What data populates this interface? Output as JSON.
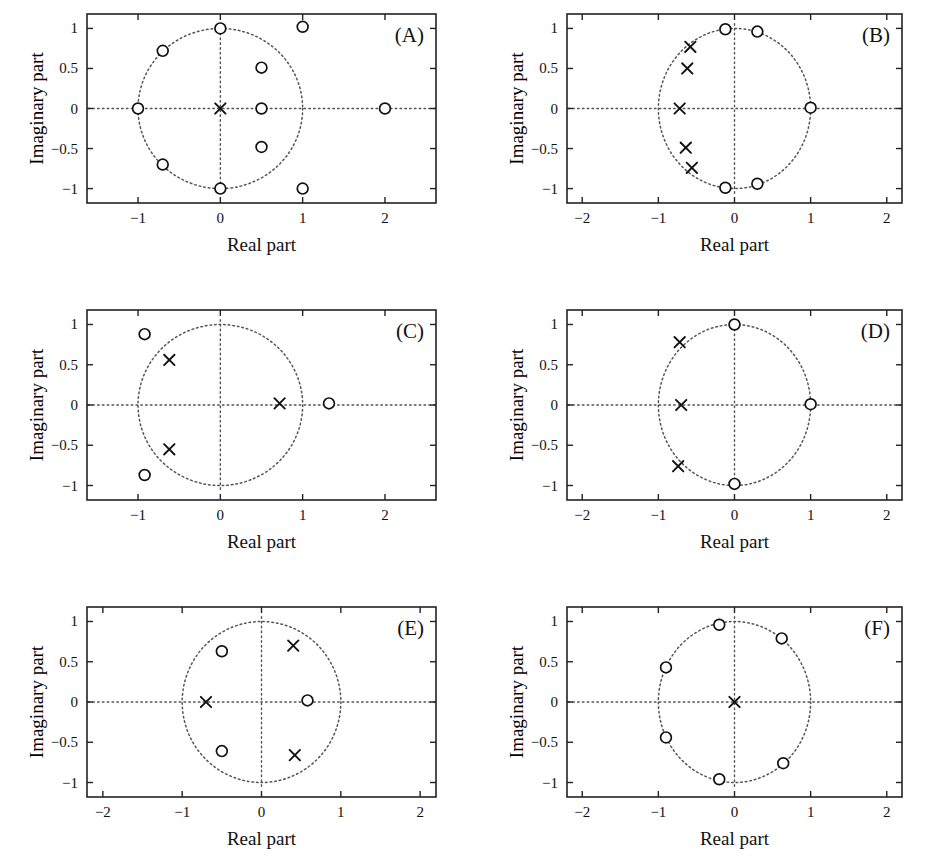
{
  "figure": {
    "type": "pole-zero-plots",
    "panel_count": 6,
    "axis_title_x": "Real part",
    "axis_title_y": "Imaginary part",
    "marker_legend": {
      "zero": "open-circle",
      "pole": "x-cross",
      "unit_circle": "dotted"
    },
    "colors": {
      "ink": "#111111",
      "axis": "#222222",
      "dotted": "#555555",
      "background": "#ffffff"
    }
  },
  "chart_data": [
    {
      "type": "scatter",
      "title": "(A)",
      "xlabel": "Real part",
      "ylabel": "Imaginary part",
      "xlim": [
        -1.62,
        2.62
      ],
      "ylim": [
        -1.18,
        1.18
      ],
      "xticks": [
        -1,
        0,
        1,
        2
      ],
      "xticklabels": [
        "−1",
        "0",
        "1",
        "2"
      ],
      "yticks": [
        -1,
        -0.5,
        0,
        0.5,
        1
      ],
      "yticklabels": [
        "−1",
        "−0.5",
        "0",
        "0.5",
        "1"
      ],
      "grid": false,
      "unit_circle": true,
      "zeros": [
        [
          0.0,
          1.0
        ],
        [
          -0.7,
          0.72
        ],
        [
          -1.0,
          0.0
        ],
        [
          -0.7,
          -0.7
        ],
        [
          0.0,
          -1.0
        ],
        [
          0.5,
          0.51
        ],
        [
          0.5,
          0.0
        ],
        [
          0.5,
          -0.48
        ],
        [
          1.0,
          1.02
        ],
        [
          1.0,
          -1.0
        ],
        [
          2.0,
          0.0
        ]
      ],
      "poles": [
        [
          0.0,
          0.0
        ]
      ]
    },
    {
      "type": "scatter",
      "title": "(B)",
      "xlabel": "Real part",
      "ylabel": "Imaginary part",
      "xlim": [
        -2.2,
        2.2
      ],
      "ylim": [
        -1.18,
        1.18
      ],
      "xticks": [
        -2,
        -1,
        0,
        1,
        2
      ],
      "xticklabels": [
        "−2",
        "−1",
        "0",
        "1",
        "2"
      ],
      "yticks": [
        -1,
        -0.5,
        0,
        0.5,
        1
      ],
      "yticklabels": [
        "−1",
        "−0.5",
        "0",
        "0.5",
        "1"
      ],
      "grid": false,
      "unit_circle": true,
      "zeros": [
        [
          -0.12,
          0.99
        ],
        [
          0.3,
          0.96
        ],
        [
          1.0,
          0.01
        ],
        [
          0.3,
          -0.94
        ],
        [
          -0.12,
          -0.99
        ]
      ],
      "poles": [
        [
          -0.58,
          0.77
        ],
        [
          -0.62,
          0.5
        ],
        [
          -0.72,
          0.0
        ],
        [
          -0.64,
          -0.49
        ],
        [
          -0.56,
          -0.74
        ]
      ]
    },
    {
      "type": "scatter",
      "title": "(C)",
      "xlabel": "Real part",
      "ylabel": "Imaginary part",
      "xlim": [
        -1.62,
        2.62
      ],
      "ylim": [
        -1.18,
        1.18
      ],
      "xticks": [
        -1,
        0,
        1,
        2
      ],
      "xticklabels": [
        "−1",
        "0",
        "1",
        "2"
      ],
      "yticks": [
        -1,
        -0.5,
        0,
        0.5,
        1
      ],
      "yticklabels": [
        "−1",
        "−0.5",
        "0",
        "0.5",
        "1"
      ],
      "grid": false,
      "unit_circle": true,
      "zeros": [
        [
          -0.92,
          0.88
        ],
        [
          -0.92,
          -0.87
        ],
        [
          1.32,
          0.02
        ]
      ],
      "poles": [
        [
          -0.62,
          0.56
        ],
        [
          -0.62,
          -0.55
        ],
        [
          0.72,
          0.02
        ]
      ]
    },
    {
      "type": "scatter",
      "title": "(D)",
      "xlabel": "Real part",
      "ylabel": "Imaginary part",
      "xlim": [
        -2.2,
        2.2
      ],
      "ylim": [
        -1.18,
        1.18
      ],
      "xticks": [
        -2,
        -1,
        0,
        1,
        2
      ],
      "xticklabels": [
        "−2",
        "−1",
        "0",
        "1",
        "2"
      ],
      "yticks": [
        -1,
        -0.5,
        0,
        0.5,
        1
      ],
      "yticklabels": [
        "−1",
        "−0.5",
        "0",
        "0.5",
        "1"
      ],
      "grid": false,
      "unit_circle": true,
      "zeros": [
        [
          0.0,
          1.0
        ],
        [
          1.0,
          0.01
        ],
        [
          0.0,
          -0.98
        ]
      ],
      "poles": [
        [
          -0.72,
          0.78
        ],
        [
          -0.7,
          0.0
        ],
        [
          -0.74,
          -0.76
        ]
      ]
    },
    {
      "type": "scatter",
      "title": "(E)",
      "xlabel": "Real part",
      "ylabel": "Imaginary part",
      "xlim": [
        -2.2,
        2.2
      ],
      "ylim": [
        -1.18,
        1.18
      ],
      "xticks": [
        -2,
        -1,
        0,
        1,
        2
      ],
      "xticklabels": [
        "−2",
        "−1",
        "0",
        "1",
        "2"
      ],
      "yticks": [
        -1,
        -0.5,
        0,
        0.5,
        1
      ],
      "yticklabels": [
        "−1",
        "−0.5",
        "0",
        "0.5",
        "1"
      ],
      "grid": false,
      "unit_circle": true,
      "zeros": [
        [
          -0.5,
          0.63
        ],
        [
          -0.5,
          -0.61
        ],
        [
          0.58,
          0.02
        ]
      ],
      "poles": [
        [
          0.4,
          0.7
        ],
        [
          -0.7,
          0.0
        ],
        [
          0.42,
          -0.66
        ]
      ]
    },
    {
      "type": "scatter",
      "title": "(F)",
      "xlabel": "Real part",
      "ylabel": "Imaginary part",
      "xlim": [
        -2.2,
        2.2
      ],
      "ylim": [
        -1.18,
        1.18
      ],
      "xticks": [
        -2,
        -1,
        0,
        1,
        2
      ],
      "xticklabels": [
        "−2",
        "−1",
        "0",
        "1",
        "2"
      ],
      "yticks": [
        -1,
        -0.5,
        0,
        0.5,
        1
      ],
      "yticklabels": [
        "−1",
        "−0.5",
        "0",
        "0.5",
        "1"
      ],
      "grid": false,
      "unit_circle": true,
      "zeros": [
        [
          -0.2,
          0.96
        ],
        [
          0.62,
          0.79
        ],
        [
          0.64,
          -0.76
        ],
        [
          -0.2,
          -0.96
        ],
        [
          -0.9,
          -0.44
        ],
        [
          -0.9,
          0.43
        ]
      ],
      "poles": [
        [
          0.0,
          0.0
        ]
      ]
    }
  ]
}
